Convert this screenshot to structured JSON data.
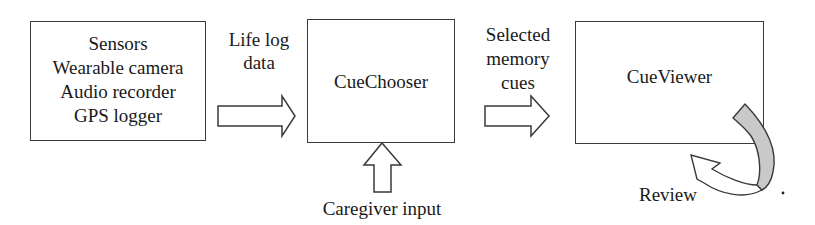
{
  "diagram": {
    "type": "flow",
    "nodes": [
      {
        "id": "sensors",
        "lines": [
          "Sensors",
          "Wearable camera",
          "Audio recorder",
          "GPS logger"
        ]
      },
      {
        "id": "cuechooser",
        "label": "CueChooser"
      },
      {
        "id": "cueviewer",
        "label": "CueViewer"
      }
    ],
    "edges": [
      {
        "from": "sensors",
        "to": "cuechooser",
        "lines": [
          "Life log",
          "data"
        ]
      },
      {
        "from": "cuechooser",
        "to": "cueviewer",
        "lines": [
          "Selected",
          "memory",
          "cues"
        ]
      },
      {
        "from": "caregiver",
        "to": "cuechooser",
        "label": "Caregiver input"
      },
      {
        "from": "cueviewer",
        "to": "cueviewer",
        "label": "Review"
      }
    ],
    "colors": {
      "stroke": "#3a3a3a",
      "ribbon_fill": "#c9c9c9",
      "arrow_fill": "#ffffff"
    }
  }
}
